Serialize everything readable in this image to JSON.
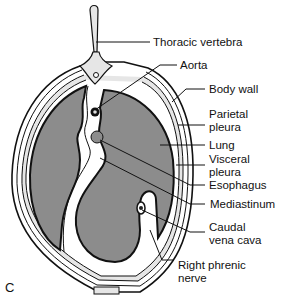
{
  "figure": {
    "panel_letter": "C",
    "labels": [
      {
        "id": "thoracic-vertebra",
        "text": "Thoracic vertebra",
        "x": 153,
        "y": 36
      },
      {
        "id": "aorta",
        "text": "Aorta",
        "x": 180,
        "y": 60
      },
      {
        "id": "body-wall",
        "text": "Body wall",
        "x": 209,
        "y": 83
      },
      {
        "id": "parietal-pleura",
        "text": "Parietal\npleura",
        "x": 209,
        "y": 108
      },
      {
        "id": "lung",
        "text": "Lung",
        "x": 209,
        "y": 138
      },
      {
        "id": "visceral-pleura",
        "text": "Visceral\npleura",
        "x": 209,
        "y": 152
      },
      {
        "id": "esophagus",
        "text": "Esophagus",
        "x": 209,
        "y": 178
      },
      {
        "id": "mediastinum",
        "text": "Mediastinum",
        "x": 210,
        "y": 197
      },
      {
        "id": "caudal-vena-cava",
        "text": "Caudal\nvena cava",
        "x": 209,
        "y": 220
      },
      {
        "id": "right-phrenic-nerve",
        "text": "Right phrenic\nnerve",
        "x": 178,
        "y": 258
      }
    ],
    "colors": {
      "lung_fill": "#8c8c8c",
      "tissue_fill": "#e6e6e6",
      "outline": "#111111",
      "background": "#ffffff"
    }
  }
}
